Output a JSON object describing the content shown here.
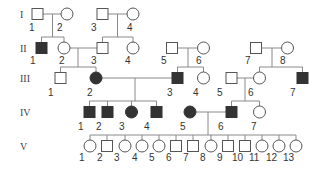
{
  "colors": {
    "affected": "#333333",
    "unaffected": "#ffffff",
    "outline": "#555555",
    "line": "#8a8a8a",
    "text": "#333333"
  },
  "generations": [
    {
      "label": "I",
      "y": 14
    },
    {
      "label": "II",
      "y": 48
    },
    {
      "label": "III",
      "y": 78
    },
    {
      "label": "IV",
      "y": 112
    },
    {
      "label": "V",
      "y": 146
    }
  ],
  "individuals": [
    {
      "id": "I-1",
      "gen": 0,
      "num": "1",
      "sex": "male",
      "affected": false,
      "x": 37.5,
      "lx": 29,
      "ly": 31
    },
    {
      "id": "I-2",
      "gen": 0,
      "num": "2",
      "sex": "female",
      "affected": false,
      "x": 67,
      "lx": 57,
      "ly": 31
    },
    {
      "id": "I-3",
      "gen": 0,
      "num": "3",
      "sex": "male",
      "affected": false,
      "x": 102.5,
      "lx": 91,
      "ly": 31
    },
    {
      "id": "I-4",
      "gen": 0,
      "num": "4",
      "sex": "female",
      "affected": false,
      "x": 133,
      "lx": 127,
      "ly": 31
    },
    {
      "id": "II-1",
      "gen": 1,
      "num": "1",
      "sex": "male",
      "affected": true,
      "x": 41.5,
      "lx": 30,
      "ly": 64
    },
    {
      "id": "II-2",
      "gen": 1,
      "num": "2",
      "sex": "female",
      "affected": false,
      "x": 64,
      "lx": 59,
      "ly": 64
    },
    {
      "id": "II-3",
      "gen": 1,
      "num": "3",
      "sex": "male",
      "affected": false,
      "x": 102.5,
      "lx": 91,
      "ly": 64
    },
    {
      "id": "II-4",
      "gen": 1,
      "num": "4",
      "sex": "female",
      "affected": false,
      "x": 133,
      "lx": 125,
      "ly": 64
    },
    {
      "id": "II-5",
      "gen": 1,
      "num": "5",
      "sex": "male",
      "affected": false,
      "x": 172,
      "lx": 161,
      "ly": 64
    },
    {
      "id": "II-6",
      "gen": 1,
      "num": "6",
      "sex": "female",
      "affected": false,
      "x": 203.5,
      "lx": 196,
      "ly": 64
    },
    {
      "id": "II-7",
      "gen": 1,
      "num": "7",
      "sex": "male",
      "affected": false,
      "x": 256,
      "lx": 245,
      "ly": 64
    },
    {
      "id": "II-8",
      "gen": 1,
      "num": "8",
      "sex": "female",
      "affected": false,
      "x": 287.5,
      "lx": 280,
      "ly": 64
    },
    {
      "id": "III-1",
      "gen": 2,
      "num": "1",
      "sex": "male",
      "affected": false,
      "x": 60.5,
      "lx": 48,
      "ly": 96
    },
    {
      "id": "III-2",
      "gen": 2,
      "num": "2",
      "sex": "female",
      "affected": true,
      "x": 96,
      "lx": 87,
      "ly": 96
    },
    {
      "id": "III-3",
      "gen": 2,
      "num": "3",
      "sex": "male",
      "affected": true,
      "x": 177.5,
      "lx": 167,
      "ly": 96
    },
    {
      "id": "III-4",
      "gen": 2,
      "num": "4",
      "sex": "female",
      "affected": false,
      "x": 203.5,
      "lx": 193,
      "ly": 96
    },
    {
      "id": "III-5",
      "gen": 2,
      "num": "5",
      "sex": "male",
      "affected": false,
      "x": 231.5,
      "lx": 217,
      "ly": 96
    },
    {
      "id": "III-6",
      "gen": 2,
      "num": "6",
      "sex": "female",
      "affected": false,
      "x": 259.5,
      "lx": 248,
      "ly": 96
    },
    {
      "id": "III-7",
      "gen": 2,
      "num": "7",
      "sex": "male",
      "affected": true,
      "x": 302.5,
      "lx": 290,
      "ly": 96
    },
    {
      "id": "IV-1",
      "gen": 3,
      "num": "1",
      "sex": "male",
      "affected": true,
      "x": 89.5,
      "lx": 78,
      "ly": 130
    },
    {
      "id": "IV-2",
      "gen": 3,
      "num": "2",
      "sex": "male",
      "affected": true,
      "x": 107.5,
      "lx": 96,
      "ly": 130
    },
    {
      "id": "IV-3",
      "gen": 3,
      "num": "3",
      "sex": "female",
      "affected": true,
      "x": 131.5,
      "lx": 119,
      "ly": 130
    },
    {
      "id": "IV-4",
      "gen": 3,
      "num": "4",
      "sex": "male",
      "affected": true,
      "x": 156.5,
      "lx": 144,
      "ly": 130
    },
    {
      "id": "IV-5",
      "gen": 3,
      "num": "5",
      "sex": "female",
      "affected": true,
      "x": 190,
      "lx": 180,
      "ly": 130
    },
    {
      "id": "IV-6",
      "gen": 3,
      "num": "6",
      "sex": "male",
      "affected": true,
      "x": 231.5,
      "lx": 218,
      "ly": 130
    },
    {
      "id": "IV-7",
      "gen": 3,
      "num": "7",
      "sex": "female",
      "affected": false,
      "x": 259.5,
      "lx": 251,
      "ly": 130
    },
    {
      "id": "V-1",
      "gen": 4,
      "num": "1",
      "sex": "female",
      "affected": false,
      "x": 90,
      "lx": 79,
      "ly": 161
    },
    {
      "id": "V-2",
      "gen": 4,
      "num": "2",
      "sex": "male",
      "affected": false,
      "x": 107,
      "lx": 97,
      "ly": 161
    },
    {
      "id": "V-3",
      "gen": 4,
      "num": "3",
      "sex": "female",
      "affected": false,
      "x": 125,
      "lx": 114,
      "ly": 161
    },
    {
      "id": "V-4",
      "gen": 4,
      "num": "4",
      "sex": "female",
      "affected": false,
      "x": 142,
      "lx": 132,
      "ly": 161
    },
    {
      "id": "V-5",
      "gen": 4,
      "num": "5",
      "sex": "female",
      "affected": false,
      "x": 159,
      "lx": 149,
      "ly": 161
    },
    {
      "id": "V-6",
      "gen": 4,
      "num": "6",
      "sex": "male",
      "affected": false,
      "x": 176,
      "lx": 166,
      "ly": 161
    },
    {
      "id": "V-7",
      "gen": 4,
      "num": "7",
      "sex": "male",
      "affected": false,
      "x": 193,
      "lx": 183,
      "ly": 161
    },
    {
      "id": "V-8",
      "gen": 4,
      "num": "8",
      "sex": "female",
      "affected": false,
      "x": 211,
      "lx": 200,
      "ly": 161
    },
    {
      "id": "V-9",
      "gen": 4,
      "num": "9",
      "sex": "male",
      "affected": false,
      "x": 228,
      "lx": 217,
      "ly": 161
    },
    {
      "id": "V-10",
      "gen": 4,
      "num": "10",
      "sex": "male",
      "affected": false,
      "x": 245,
      "lx": 232,
      "ly": 161
    },
    {
      "id": "V-11",
      "gen": 4,
      "num": "11",
      "sex": "female",
      "affected": false,
      "x": 262,
      "lx": 249,
      "ly": 161
    },
    {
      "id": "V-12",
      "gen": 4,
      "num": "12",
      "sex": "female",
      "affected": false,
      "x": 279,
      "lx": 266,
      "ly": 161
    },
    {
      "id": "V-13",
      "gen": 4,
      "num": "13",
      "sex": "female",
      "affected": false,
      "x": 296,
      "lx": 283,
      "ly": 161
    }
  ],
  "lines": [
    [
      43,
      14,
      61,
      14
    ],
    [
      52.5,
      14,
      52.5,
      37
    ],
    [
      41.5,
      37,
      64,
      37
    ],
    [
      41.5,
      37,
      41.5,
      43
    ],
    [
      64,
      37,
      64,
      43
    ],
    [
      108,
      14,
      127,
      14
    ],
    [
      117.5,
      14,
      117.5,
      37
    ],
    [
      102.5,
      37,
      133,
      37
    ],
    [
      102.5,
      37,
      102.5,
      43
    ],
    [
      133,
      37,
      133,
      43
    ],
    [
      70,
      48,
      97,
      48
    ],
    [
      78,
      48,
      78,
      67
    ],
    [
      60.5,
      67,
      96,
      67
    ],
    [
      60.5,
      67,
      60.5,
      72
    ],
    [
      96,
      67,
      96,
      72
    ],
    [
      178,
      48,
      198,
      48
    ],
    [
      188,
      48,
      188,
      67
    ],
    [
      177.5,
      67,
      203.5,
      67
    ],
    [
      177.5,
      67,
      177.5,
      72
    ],
    [
      203.5,
      67,
      203.5,
      72
    ],
    [
      262,
      48,
      282,
      48
    ],
    [
      272,
      48,
      272,
      67
    ],
    [
      259.5,
      67,
      302.5,
      67
    ],
    [
      259.5,
      67,
      259.5,
      72
    ],
    [
      302.5,
      67,
      302.5,
      72
    ],
    [
      102,
      78,
      172,
      78
    ],
    [
      135,
      78,
      135,
      101
    ],
    [
      89.5,
      101,
      156.5,
      101
    ],
    [
      89.5,
      101,
      89.5,
      107
    ],
    [
      107.5,
      101,
      107.5,
      107
    ],
    [
      131.5,
      101,
      131.5,
      107
    ],
    [
      156.5,
      101,
      156.5,
      107
    ],
    [
      237,
      78,
      254,
      78
    ],
    [
      245,
      78,
      245,
      101
    ],
    [
      231.5,
      101,
      259.5,
      101
    ],
    [
      231.5,
      101,
      231.5,
      107
    ],
    [
      259.5,
      101,
      259.5,
      107
    ],
    [
      196,
      112,
      226,
      112
    ],
    [
      208,
      112,
      208,
      135
    ],
    [
      90,
      135,
      296,
      135
    ],
    [
      90,
      135,
      90,
      140
    ],
    [
      107,
      135,
      107,
      140
    ],
    [
      125,
      135,
      125,
      140
    ],
    [
      142,
      135,
      142,
      140
    ],
    [
      159,
      135,
      159,
      140
    ],
    [
      176,
      135,
      176,
      140
    ],
    [
      193,
      135,
      193,
      140
    ],
    [
      211,
      135,
      211,
      140
    ],
    [
      228,
      135,
      228,
      140
    ],
    [
      245,
      135,
      245,
      140
    ],
    [
      262,
      135,
      262,
      140
    ],
    [
      279,
      135,
      279,
      140
    ],
    [
      296,
      135,
      296,
      140
    ]
  ]
}
